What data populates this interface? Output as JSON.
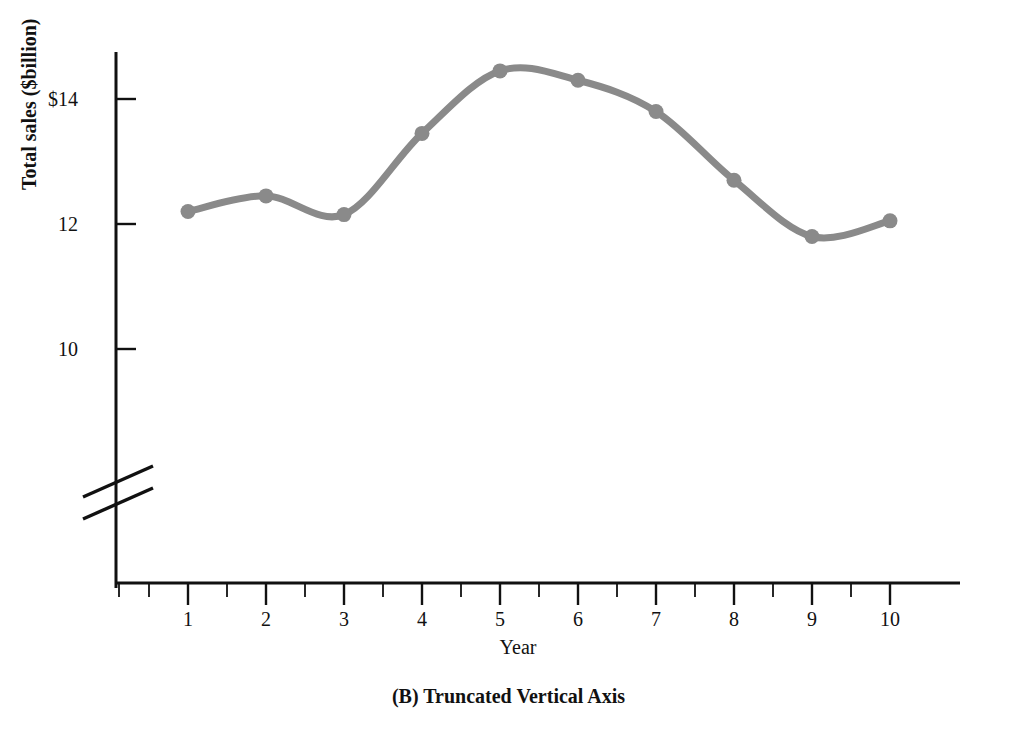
{
  "chart_data": {
    "type": "line",
    "title": "(B) Truncated Vertical Axis",
    "xlabel": "Year",
    "ylabel": "Total sales ($billion)",
    "x": [
      1,
      2,
      3,
      4,
      5,
      6,
      7,
      8,
      9,
      10
    ],
    "values": [
      12.2,
      12.45,
      12.15,
      13.45,
      14.45,
      14.3,
      13.8,
      12.7,
      11.8,
      12.05
    ],
    "series": [
      {
        "name": "Total sales",
        "values": [
          12.2,
          12.45,
          12.15,
          13.45,
          14.45,
          14.3,
          13.8,
          12.7,
          11.8,
          12.05
        ]
      }
    ],
    "x_tick_labels": [
      "1",
      "2",
      "3",
      "4",
      "5",
      "6",
      "7",
      "8",
      "9",
      "10"
    ],
    "y_tick_labels": [
      "$14",
      "12",
      "10"
    ],
    "y_tick_values": [
      14,
      12,
      10
    ],
    "xlim": [
      0.5,
      10.5
    ],
    "ylim": [
      9.4,
      14.9
    ],
    "grid": false,
    "legend": false,
    "axis_truncated": true,
    "truncation_marker": "double-slash",
    "line_color": "#8a8a8a",
    "marker_color": "#8a8a8a",
    "axis_color": "#111111",
    "minor_ticks": true,
    "annotations": []
  },
  "figure": {
    "caption": "(B) Truncated Vertical Axis",
    "y_axis_title": "Total sales ($billion)",
    "x_axis_title": "Year"
  },
  "ticks": {
    "y": [
      {
        "label": "$14",
        "value": 14
      },
      {
        "label": "12",
        "value": 12
      },
      {
        "label": "10",
        "value": 10
      }
    ],
    "x": [
      {
        "label": "1",
        "value": 1
      },
      {
        "label": "2",
        "value": 2
      },
      {
        "label": "3",
        "value": 3
      },
      {
        "label": "4",
        "value": 4
      },
      {
        "label": "5",
        "value": 5
      },
      {
        "label": "6",
        "value": 6
      },
      {
        "label": "7",
        "value": 7
      },
      {
        "label": "8",
        "value": 8
      },
      {
        "label": "9",
        "value": 9
      },
      {
        "label": "10",
        "value": 10
      }
    ]
  },
  "colors": {
    "line": "#8a8a8a",
    "axis": "#111111",
    "text": "#111111",
    "background": "#ffffff"
  }
}
